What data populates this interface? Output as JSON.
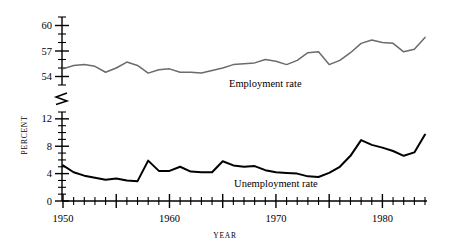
{
  "chart_data": {
    "type": "line",
    "title": "",
    "xlabel": "YEAR",
    "ylabel": "PERCENT",
    "xlim": [
      1950,
      1984
    ],
    "x_major_ticks": [
      1950,
      1955,
      1960,
      1965,
      1970,
      1975,
      1980
    ],
    "x_tick_labels": [
      "1950",
      "1960",
      "1970",
      "1980"
    ],
    "x_labeled_ticks": [
      1950,
      1960,
      1970,
      1980
    ],
    "x_minor_step": 1,
    "grid": false,
    "legend_position": "inline-annotation",
    "broken_axis": true,
    "y_axis_lower": {
      "range": [
        0,
        13
      ],
      "labeled_ticks": [
        0,
        4,
        8,
        12
      ],
      "labels": [
        "0",
        "4",
        "8",
        "12"
      ],
      "minor_step": 1
    },
    "y_axis_upper": {
      "range": [
        53,
        61
      ],
      "labeled_ticks": [
        54,
        57,
        60
      ],
      "labels": [
        "54",
        "57",
        "60"
      ],
      "minor_step": 1
    },
    "colors": {
      "employment_line": "#6b6b6b",
      "unemployment_line": "#000000",
      "axis": "#000000",
      "background": "#ffffff"
    },
    "x": [
      1950,
      1951,
      1952,
      1953,
      1954,
      1955,
      1956,
      1957,
      1958,
      1959,
      1960,
      1961,
      1962,
      1963,
      1964,
      1965,
      1966,
      1967,
      1968,
      1969,
      1970,
      1971,
      1972,
      1973,
      1974,
      1975,
      1976,
      1977,
      1978,
      1979,
      1980,
      1981,
      1982,
      1983,
      1984
    ],
    "series": [
      {
        "name": "Employment rate",
        "label": "Employment rate",
        "color": "#6b6b6b",
        "axis": "upper",
        "values": [
          54.9,
          55.3,
          55.4,
          55.2,
          54.5,
          55.0,
          55.7,
          55.3,
          54.4,
          54.8,
          54.9,
          54.5,
          54.5,
          54.4,
          54.7,
          55.0,
          55.4,
          55.5,
          55.6,
          56.0,
          55.8,
          55.4,
          55.9,
          56.8,
          56.9,
          55.4,
          55.9,
          56.8,
          57.9,
          58.3,
          58.0,
          57.9,
          56.9,
          57.2,
          58.6
        ],
        "sample_note": "civilian employment-population ratio, percent"
      },
      {
        "name": "Unemployment rate",
        "label": "Unemployment rate",
        "color": "#000000",
        "axis": "lower",
        "values": [
          5.2,
          4.2,
          3.7,
          3.4,
          3.1,
          3.3,
          3.0,
          2.9,
          5.9,
          4.4,
          4.4,
          5.0,
          4.3,
          4.2,
          4.2,
          5.8,
          5.2,
          5.0,
          5.1,
          4.5,
          4.2,
          4.1,
          4.0,
          3.6,
          3.5,
          4.1,
          5.0,
          6.6,
          8.9,
          8.2,
          7.8,
          7.3,
          6.6,
          7.1,
          9.7
        ],
        "sample_note": "civilian unemployment rate, percent"
      }
    ],
    "annotations": [
      {
        "text": "Employment rate",
        "x_year": 1969,
        "y_percent": 52.8
      },
      {
        "text": "Unemployment rate",
        "x_year": 1970,
        "y_percent": 2.0
      }
    ]
  }
}
